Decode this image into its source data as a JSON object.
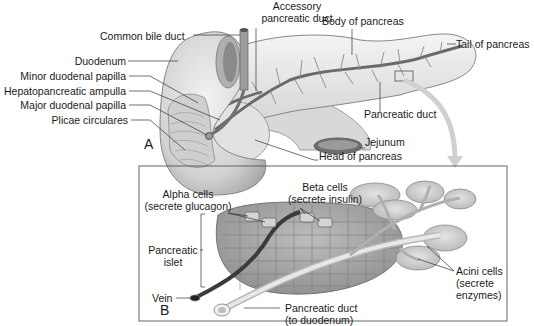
{
  "figure": {
    "panel_a": {
      "letter": "A",
      "labels": {
        "accessory_duct_line1": "Accessory",
        "accessory_duct_line2": "pancreatic duct",
        "common_bile_duct": "Common bile duct",
        "body_of_pancreas": "Body of pancreas",
        "tail_of_pancreas": "Tail of pancreas",
        "duodenum": "Duodenum",
        "minor_duodenal_papilla": "Minor duodenal papilla",
        "hepatopancreatic_ampulla": "Hepatopancreatic ampulla",
        "major_duodenal_papilla": "Major duodenal papilla",
        "plicae_circulares": "Plicae circulares",
        "pancreatic_duct": "Pancreatic duct",
        "jejunum": "Jejunum",
        "head_of_pancreas": "Head of pancreas"
      }
    },
    "panel_b": {
      "letter": "B",
      "labels": {
        "alpha_cells_line1": "Alpha cells",
        "alpha_cells_line2": "(secrete glucagon)",
        "beta_cells_line1": "Beta cells",
        "beta_cells_line2": "(secrete insulin)",
        "pancreatic_islet_line1": "Pancreatic",
        "pancreatic_islet_line2": "islet",
        "vein": "Vein",
        "pancreatic_duct_line1": "Pancreatic duct",
        "pancreatic_duct_line2": "(to duodenum)",
        "acini_line1": "Acini cells",
        "acini_line2": "(secrete",
        "acini_line3": "enzymes)"
      }
    },
    "colors": {
      "tissue_light": "#e6e6e6",
      "tissue_mid": "#c4c4c4",
      "tissue_dark": "#8a8a8a",
      "duct": "#7a7a7a",
      "line": "#333333"
    }
  }
}
